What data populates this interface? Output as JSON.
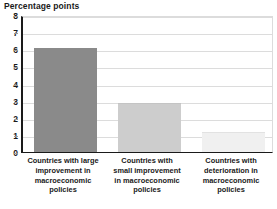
{
  "chart_data": {
    "type": "bar",
    "title": "Percentage points",
    "xlabel": "",
    "ylabel": "Percentage points",
    "ylim": [
      0,
      8
    ],
    "ytick_labels": [
      "8",
      "7",
      "6",
      "5",
      "4",
      "3",
      "2",
      "1",
      "0"
    ],
    "yticks": [
      8,
      7,
      6,
      5,
      4,
      3,
      2,
      1,
      0
    ],
    "grid": true,
    "legend": "none",
    "categories": [
      "Countries with large improvement in macroeconomic policies",
      "Countries with small improvement in macroeconomic policies",
      "Countries with deterioration in macroeconomic policies"
    ],
    "values": [
      6.1,
      2.85,
      1.15
    ],
    "bar_colors": [
      "#8a8a8a",
      "#cdcdcd",
      "#f0f0f0"
    ],
    "bar_border_colors": [
      "#8a8a8a",
      "#c4c4c4",
      "#e2e2e2"
    ]
  },
  "axis": {
    "ticks": [
      {
        "label": "8",
        "value": 8
      },
      {
        "label": "7",
        "value": 7
      },
      {
        "label": "6",
        "value": 6
      },
      {
        "label": "5",
        "value": 5
      },
      {
        "label": "4",
        "value": 4
      },
      {
        "label": "3",
        "value": 3
      },
      {
        "label": "2",
        "value": 2
      },
      {
        "label": "1",
        "value": 1
      },
      {
        "label": "0",
        "value": 0
      }
    ]
  },
  "category_labels": [
    {
      "lines": [
        "Countries with large",
        "improvement in",
        "macroeconomic",
        "policies"
      ],
      "full": "Countries with large improvement in macroeconomic policies"
    },
    {
      "lines": [
        "Countries with",
        "small improvement",
        "in macroeconomic",
        "policies"
      ],
      "full": "Countries with small improvement in macroeconomic policies"
    },
    {
      "lines": [
        "Countries with",
        "deterioration in",
        "macroeconomic",
        "policies"
      ],
      "full": "Countries with deterioration in macroeconomic policies"
    }
  ],
  "colors": {
    "axis": "#1a1a1a",
    "grid": "#dcdcdc",
    "background": "#ffffff",
    "text": "#1a1a1a"
  }
}
